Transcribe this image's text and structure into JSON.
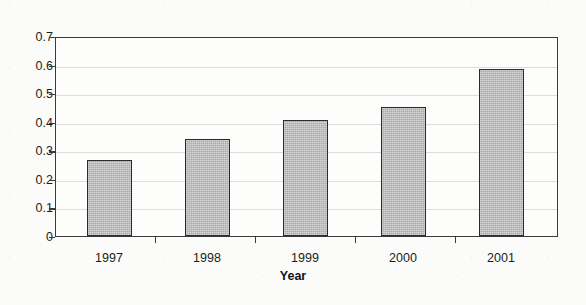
{
  "chart_data": {
    "type": "bar",
    "title": "",
    "subtitle": "",
    "xlabel": "Year",
    "ylabel": "",
    "categories": [
      "1997",
      "1998",
      "1999",
      "2000",
      "2001"
    ],
    "values": [
      0.27,
      0.345,
      0.415,
      0.46,
      0.595
    ],
    "series": [
      {
        "name": "",
        "values": [
          0.27,
          0.345,
          0.415,
          0.46,
          0.595
        ]
      }
    ],
    "ylim": [
      0,
      0.7
    ],
    "ytick_labels": [
      "0",
      "0.1",
      "0.2",
      "0.3",
      "0.4",
      "0.5",
      "0.6",
      "0.7"
    ],
    "ytick_values": [
      0,
      0.1,
      0.2,
      0.3,
      0.4,
      0.5,
      0.6,
      0.7
    ],
    "grid": true,
    "legend": false,
    "legend_position": "none",
    "bar_fill_color": "#a9a9a9",
    "bar_border_color": "#2b2b2b",
    "axis_color": "#3a3a3a",
    "background_color": "#fbfbfa",
    "plot_background_color": "#fdfdfc"
  }
}
